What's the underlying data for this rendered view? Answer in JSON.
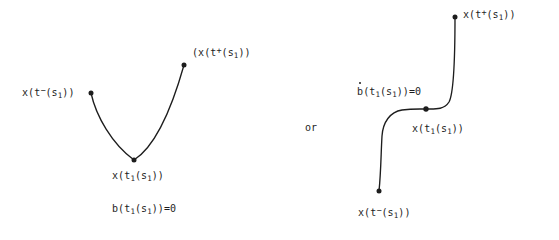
{
  "figure": {
    "background_color": "#ffffff",
    "ink_color": "#1d1d1d",
    "connector_text": "or"
  },
  "left_diagram": {
    "name": "b-vanishes-case",
    "curve_shape": "u-shaped-parabolic-arc",
    "labels": {
      "start_point": {
        "text_parts": {
          "pre": "x(t",
          "sup": "−",
          "mid": "(s",
          "sub": "1",
          "post": "))"
        },
        "plain": "x(t−(s1))",
        "point": {
          "x": 91,
          "y": 93
        }
      },
      "minimum_point": {
        "text_parts": {
          "pre": "x(t",
          "sub1": "1",
          "mid": "(s",
          "sub2": "1",
          "post": "))"
        },
        "plain": "x(t1(s1))",
        "point": {
          "x": 134,
          "y": 160
        }
      },
      "end_point": {
        "text_parts": {
          "pre": "(x(t",
          "sup": "+",
          "mid": "(s",
          "sub": "1",
          "post": "))"
        },
        "plain": "(x(t+(s1))",
        "point": {
          "x": 184,
          "y": 65
        }
      },
      "condition": {
        "text_parts": {
          "pre": "b(t",
          "sub1": "1",
          "mid": "(s",
          "sub2": "1",
          "post": "))=0"
        },
        "plain": "b(t1(s1))=0",
        "accent": "none"
      }
    }
  },
  "right_diagram": {
    "name": "bdot-vanishes-case",
    "curve_shape": "s-shaped-staircase-arc",
    "labels": {
      "end_point": {
        "text_parts": {
          "pre": "x(t",
          "sup": "+",
          "mid": "(s",
          "sub": "1",
          "post": "))"
        },
        "plain": "x(t+(s1))",
        "point": {
          "x": 455,
          "y": 17
        }
      },
      "middle_point": {
        "text_parts": {
          "pre": "x(t",
          "sub1": "1",
          "mid": "(s",
          "sub2": "1",
          "post": "))"
        },
        "plain": "x(t1(s1))",
        "point": {
          "x": 426,
          "y": 109
        }
      },
      "start_point": {
        "text_parts": {
          "pre": "x(t",
          "sup": "−",
          "mid": "(s",
          "sub": "1",
          "post": "))"
        },
        "plain": "x(t−(s1))",
        "point": {
          "x": 379,
          "y": 191
        }
      },
      "condition": {
        "text_parts": {
          "accented": "b",
          "pre": "(t",
          "sub1": "1",
          "mid": "(s",
          "sub2": "1",
          "post": "))=0"
        },
        "plain": "bdot(t1(s1))=0",
        "accent": "overdot"
      }
    }
  }
}
